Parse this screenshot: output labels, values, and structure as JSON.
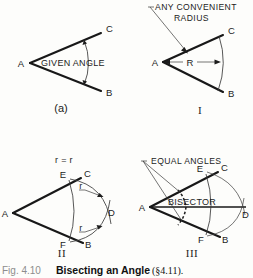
{
  "figure": {
    "caption": {
      "number": "Fig. 4.10",
      "title": "Bisecting an Angle",
      "section": "(§4.11)."
    },
    "panels": [
      {
        "id": "a",
        "label": "(a)",
        "vertex_label": "A",
        "upper_ray_label": "C",
        "lower_ray_label": "B",
        "annotation": "GIVEN ANGLE"
      },
      {
        "id": "I",
        "label": "I",
        "vertex_label": "A",
        "upper_ray_label": "C",
        "lower_ray_label": "B",
        "radius_label": "R",
        "annotation_line1": "ANY CONVENIENT",
        "annotation_line2": "RADIUS"
      },
      {
        "id": "II",
        "label": "II",
        "vertex_label": "A",
        "upper_ray_label": "C",
        "lower_ray_label": "B",
        "upper_point_label": "E",
        "lower_point_label": "F",
        "intersection_label": "D",
        "equality_note": "r = r",
        "radius_upper": "r",
        "radius_lower": "r"
      },
      {
        "id": "III",
        "label": "III",
        "vertex_label": "A",
        "upper_ray_label": "C",
        "lower_ray_label": "B",
        "upper_point_label": "E",
        "lower_point_label": "F",
        "intersection_label": "D",
        "annotation": "EQUAL ANGLES",
        "bisector_label": "BISECTOR"
      }
    ]
  }
}
